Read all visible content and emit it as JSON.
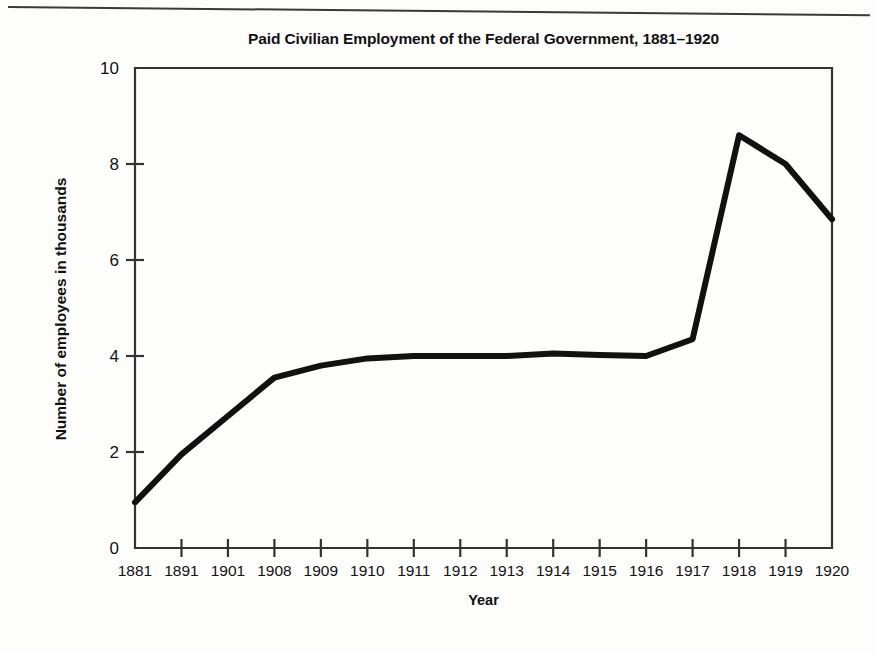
{
  "chart_data": {
    "type": "line",
    "title": "Paid Civilian Employment of the Federal Government, 1881–1920",
    "xlabel": "Year",
    "ylabel": "Number of employees in thousands",
    "categories": [
      "1881",
      "1891",
      "1901",
      "1908",
      "1909",
      "1910",
      "1911",
      "1912",
      "1913",
      "1914",
      "1915",
      "1916",
      "1917",
      "1918",
      "1919",
      "1920"
    ],
    "values": [
      0.95,
      1.95,
      2.75,
      3.55,
      3.8,
      3.95,
      4.0,
      4.0,
      4.0,
      4.05,
      4.02,
      4.0,
      4.35,
      8.6,
      8.0,
      6.85
    ],
    "ylim": [
      0,
      10
    ],
    "y_ticks": [
      "0",
      "2",
      "4",
      "6",
      "8",
      "10"
    ],
    "y_tick_values": [
      0,
      2,
      4,
      6,
      8,
      10
    ],
    "grid": false,
    "legend": "none",
    "line_color": "#111111",
    "line_width": 6,
    "series": [
      {
        "name": "Paid civilian employment",
        "values": [
          0.95,
          1.95,
          2.75,
          3.55,
          3.8,
          3.95,
          4.0,
          4.0,
          4.0,
          4.05,
          4.02,
          4.0,
          4.35,
          8.6,
          8.0,
          6.85
        ]
      }
    ]
  },
  "figure": {
    "frame_color": "#333333",
    "background": "#fdfdfc"
  }
}
